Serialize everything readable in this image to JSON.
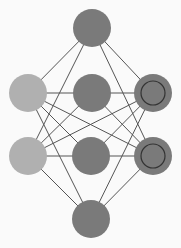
{
  "diagram": {
    "type": "neural-network",
    "colors": {
      "background": "#fafafa",
      "edge": "#555555",
      "node_dark": "#7a7a7a",
      "node_light": "#b0b0b0",
      "ring": "#333333"
    },
    "nodes": [
      {
        "id": "top",
        "x": 92,
        "y": 28,
        "fill": "#7a7a7a",
        "ring": false
      },
      {
        "id": "left1",
        "x": 28,
        "y": 93,
        "fill": "#b0b0b0",
        "ring": false
      },
      {
        "id": "mid1",
        "x": 92,
        "y": 93,
        "fill": "#7a7a7a",
        "ring": false
      },
      {
        "id": "right1",
        "x": 153,
        "y": 93,
        "fill": "#7a7a7a",
        "ring": true
      },
      {
        "id": "left2",
        "x": 28,
        "y": 156,
        "fill": "#b0b0b0",
        "ring": false
      },
      {
        "id": "mid2",
        "x": 91,
        "y": 156,
        "fill": "#7a7a7a",
        "ring": false
      },
      {
        "id": "right2",
        "x": 153,
        "y": 156,
        "fill": "#7a7a7a",
        "ring": true
      },
      {
        "id": "bottom",
        "x": 91,
        "y": 219,
        "fill": "#7a7a7a",
        "ring": false
      }
    ],
    "edges": [
      [
        "top",
        "left1"
      ],
      [
        "top",
        "right1"
      ],
      [
        "top",
        "left2"
      ],
      [
        "top",
        "right2"
      ],
      [
        "left1",
        "mid1"
      ],
      [
        "mid1",
        "right1"
      ],
      [
        "left1",
        "mid2"
      ],
      [
        "left1",
        "right2"
      ],
      [
        "mid1",
        "left2"
      ],
      [
        "mid1",
        "right2"
      ],
      [
        "right1",
        "left2"
      ],
      [
        "right1",
        "mid2"
      ],
      [
        "left2",
        "mid2"
      ],
      [
        "mid2",
        "right2"
      ],
      [
        "left1",
        "bottom"
      ],
      [
        "right1",
        "bottom"
      ],
      [
        "left2",
        "bottom"
      ],
      [
        "right2",
        "bottom"
      ]
    ]
  }
}
